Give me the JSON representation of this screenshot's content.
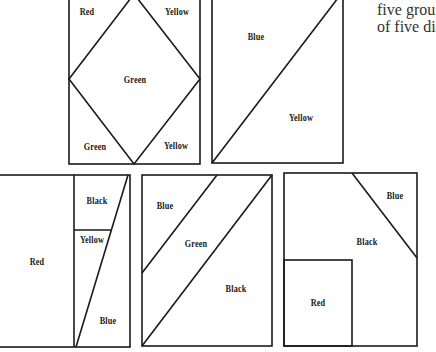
{
  "side_text": {
    "line1": "five grou",
    "line2": "of five di"
  },
  "panels": [
    {
      "id": "panel-1",
      "labels": [
        "Red",
        "Yellow",
        "Green",
        "Green",
        "Yellow"
      ]
    },
    {
      "id": "panel-2",
      "labels": [
        "Blue",
        "Yellow"
      ]
    },
    {
      "id": "panel-3",
      "labels": [
        "Red",
        "Black",
        "Yellow",
        "Blue"
      ]
    },
    {
      "id": "panel-4",
      "labels": [
        "Blue",
        "Green",
        "Black"
      ]
    },
    {
      "id": "panel-5",
      "labels": [
        "Blue",
        "Black",
        "Red"
      ]
    }
  ],
  "colors": {
    "stroke": "#1a1a1a",
    "background": "#ffffff"
  }
}
